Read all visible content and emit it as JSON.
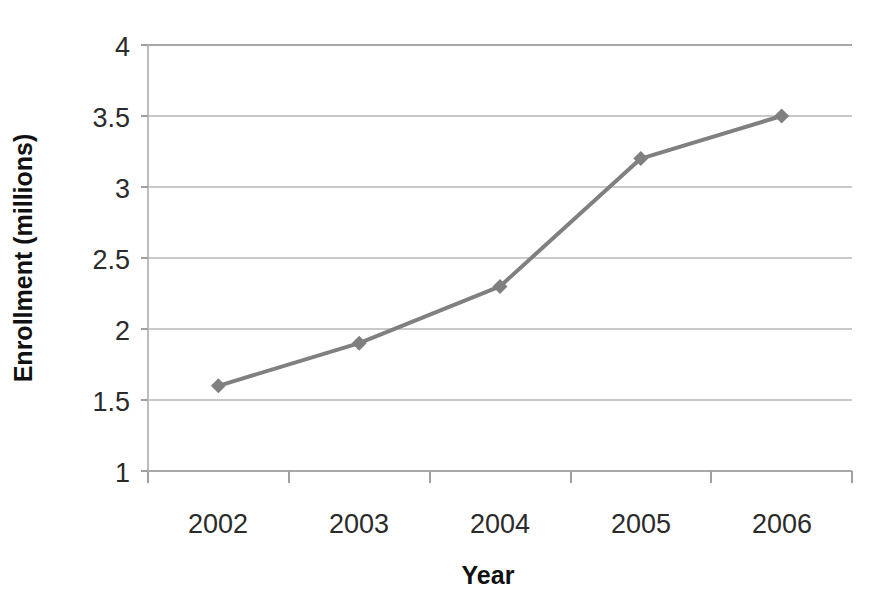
{
  "chart_data": {
    "type": "line",
    "title": "",
    "xlabel": "Year",
    "ylabel": "Enrollment (millions)",
    "categories": [
      "2002",
      "2003",
      "2004",
      "2005",
      "2006"
    ],
    "values": [
      1.6,
      1.9,
      2.3,
      3.2,
      3.5
    ],
    "series": [
      {
        "name": "Enrollment",
        "values": [
          1.6,
          1.9,
          2.3,
          3.2,
          3.5
        ]
      }
    ],
    "ylim": [
      1,
      4
    ],
    "yticks": [
      1,
      1.5,
      2,
      2.5,
      3,
      3.5,
      4
    ],
    "ytick_labels": [
      "1",
      "1.5",
      "2",
      "2.5",
      "3",
      "3.5",
      "4"
    ],
    "grid": true,
    "legend": false,
    "legend_position": "none",
    "series_color": "#808080",
    "marker": "diamond",
    "background_color": "#ffffff",
    "gridline_color": "#c9c9c9",
    "axis_color": "#a8a8a8",
    "text_color": "#2b2b2b"
  }
}
